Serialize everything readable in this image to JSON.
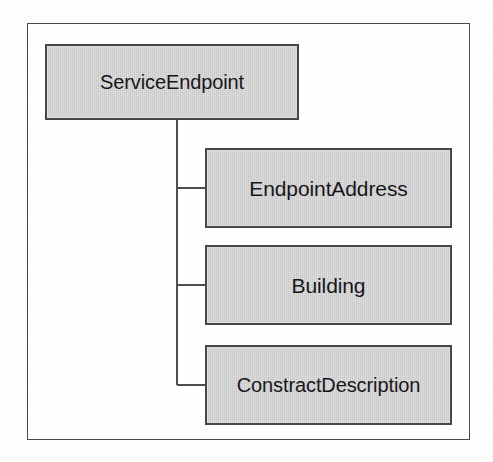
{
  "diagram": {
    "type": "tree",
    "title": "",
    "frame": {
      "border_color": "#4a4a4a",
      "background": "#ffffff"
    },
    "style": {
      "box_fill": "#d2d2d2",
      "box_border": "#474747",
      "text_color": "#17171a",
      "connector_color": "#4d4d4d"
    },
    "root": {
      "label": "ServiceEndpoint"
    },
    "children": [
      {
        "label": "EndpointAddress"
      },
      {
        "label": "Building"
      },
      {
        "label": "ConstractDescription"
      }
    ]
  }
}
